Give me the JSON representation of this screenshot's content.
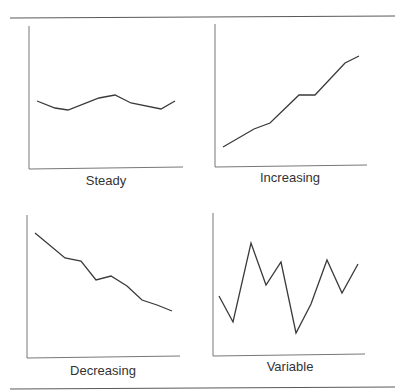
{
  "figure": {
    "panels": [
      {
        "label": "Steady"
      },
      {
        "label": "Increasing"
      },
      {
        "label": "Decreasing"
      },
      {
        "label": "Variable"
      }
    ]
  },
  "chart_data": [
    {
      "type": "line",
      "title": "Steady",
      "xlabel": "Steady",
      "ylabel": "",
      "grid": false,
      "x": [
        0,
        1,
        2,
        3,
        4,
        5,
        6,
        7
      ],
      "values": [
        0.48,
        0.42,
        0.4,
        0.5,
        0.53,
        0.46,
        0.41,
        0.48
      ],
      "ylim": [
        0,
        1
      ],
      "points_px": [
        [
          37,
          101
        ],
        [
          55,
          108
        ],
        [
          68,
          110
        ],
        [
          99,
          98
        ],
        [
          115,
          95
        ],
        [
          131,
          103
        ],
        [
          161,
          109
        ],
        [
          175,
          101
        ]
      ]
    },
    {
      "type": "line",
      "title": "Increasing",
      "xlabel": "Increasing",
      "ylabel": "",
      "grid": false,
      "x": [
        0,
        1,
        2,
        3,
        4,
        5,
        6
      ],
      "values": [
        0.13,
        0.26,
        0.31,
        0.5,
        0.5,
        0.73,
        0.77
      ],
      "ylim": [
        0,
        1
      ],
      "points_px": [
        [
          223,
          147
        ],
        [
          254,
          129
        ],
        [
          270,
          123
        ],
        [
          299,
          95
        ],
        [
          315,
          95
        ],
        [
          345,
          63
        ],
        [
          359,
          56
        ]
      ]
    },
    {
      "type": "line",
      "title": "Decreasing",
      "xlabel": "Decreasing",
      "ylabel": "",
      "grid": false,
      "x": [
        0,
        1,
        2,
        3,
        4,
        5,
        6,
        7,
        8
      ],
      "values": [
        0.88,
        0.7,
        0.68,
        0.55,
        0.58,
        0.5,
        0.41,
        0.37,
        0.33
      ],
      "ylim": [
        0,
        1
      ],
      "points_px": [
        [
          35,
          233
        ],
        [
          65,
          258
        ],
        [
          81,
          261
        ],
        [
          96,
          280
        ],
        [
          111,
          276
        ],
        [
          127,
          286
        ],
        [
          142,
          300
        ],
        [
          157,
          305
        ],
        [
          172,
          311
        ]
      ]
    },
    {
      "type": "line",
      "title": "Variable",
      "xlabel": "Variable",
      "ylabel": "",
      "grid": false,
      "x": [
        0,
        1,
        2,
        3,
        4,
        5,
        6,
        7,
        8,
        9
      ],
      "values": [
        0.41,
        0.23,
        0.78,
        0.49,
        0.65,
        0.15,
        0.35,
        0.66,
        0.43,
        0.63
      ],
      "ylim": [
        0,
        1
      ],
      "points_px": [
        [
          219,
          296
        ],
        [
          233,
          322
        ],
        [
          251,
          243
        ],
        [
          266,
          285
        ],
        [
          281,
          262
        ],
        [
          296,
          333
        ],
        [
          311,
          304
        ],
        [
          327,
          260
        ],
        [
          342,
          293
        ],
        [
          358,
          264
        ]
      ]
    }
  ]
}
